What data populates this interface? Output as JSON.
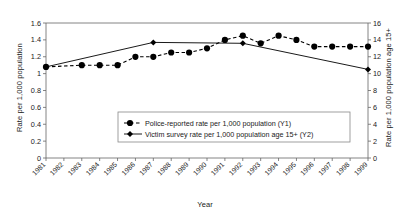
{
  "chart_data": {
    "type": "line",
    "title": "",
    "xlabel": "Year",
    "y1label": "Rate per 1,000 population",
    "y2label": "Rate per 1,000 population age 15+",
    "grid": false,
    "legend_position": "inside-bottom-center",
    "categories": [
      "1981",
      "1982",
      "1983",
      "1984",
      "1985",
      "1986",
      "1987",
      "1988",
      "1989",
      "1990",
      "1991",
      "1992",
      "1993",
      "1994",
      "1995",
      "1996",
      "1997",
      "1998",
      "1999"
    ],
    "y1lim": [
      0,
      1.6
    ],
    "y1ticks": [
      "0",
      "0.2",
      "0.4",
      "0.6",
      "0.8",
      "1",
      "1.2",
      "1.4",
      "1.6"
    ],
    "y2lim": [
      0,
      16
    ],
    "y2ticks": [
      "0",
      "2",
      "4",
      "6",
      "8",
      "10",
      "12",
      "14",
      "16"
    ],
    "series": [
      {
        "name": "Police-reported rate per 1,000 population (Y1)",
        "axis": "y1",
        "style": "dashed",
        "marker": "circle",
        "color": "#000000",
        "values": [
          1.08,
          null,
          1.1,
          1.1,
          1.1,
          1.2,
          1.2,
          1.25,
          1.25,
          1.3,
          1.4,
          1.45,
          1.36,
          1.45,
          1.4,
          1.32,
          1.32,
          1.32,
          1.32
        ]
      },
      {
        "name": "Victim survey rate per 1,000 population age 15+ (Y2)",
        "axis": "y2",
        "style": "solid",
        "marker": "diamond",
        "color": "#000000",
        "values": [
          10.8,
          null,
          null,
          null,
          null,
          null,
          13.7,
          null,
          null,
          null,
          null,
          13.6,
          null,
          null,
          null,
          null,
          null,
          null,
          10.5
        ]
      }
    ]
  },
  "legend": {
    "entries": [
      {
        "label": "Police-reported rate per 1,000 population (Y1)"
      },
      {
        "label": "Victim survey rate per 1,000 population age 15+ (Y2)"
      }
    ]
  }
}
